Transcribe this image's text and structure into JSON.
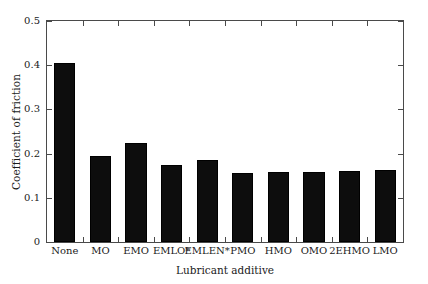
{
  "chart_data": {
    "type": "bar",
    "title": "",
    "xlabel": "Lubricant additive",
    "ylabel": "Coefficient of friction",
    "categories": [
      "None",
      "MO",
      "EMO",
      "EMLO*",
      "EMLEN*",
      "PMO",
      "HMO",
      "OMO",
      "2EHMO",
      "LMO"
    ],
    "values": [
      0.405,
      0.194,
      0.225,
      0.175,
      0.186,
      0.157,
      0.158,
      0.158,
      0.16,
      0.162
    ],
    "ylim": [
      0,
      0.5
    ],
    "yticks": [
      0,
      0.1,
      0.2,
      0.3,
      0.4,
      0.5
    ],
    "ytick_labels": [
      "0",
      "0.1",
      "0.2",
      "0.3",
      "0.4",
      "0.5"
    ],
    "grid": false,
    "legend": null,
    "bar_color": "#0d0d0d",
    "frame_color": "#4a4a4a"
  }
}
